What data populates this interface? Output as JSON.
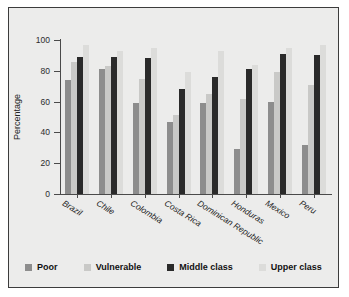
{
  "chart_data": {
    "type": "bar",
    "title": "",
    "xlabel": "",
    "ylabel": "Percentage",
    "ylim": [
      0,
      100
    ],
    "yticks": [
      0,
      20,
      40,
      60,
      80,
      100
    ],
    "grid": false,
    "legend_position": "bottom",
    "categories": [
      "Brazil",
      "Chile",
      "Colombia",
      "Costa Rica",
      "Dominican Republic",
      "Honduras",
      "Mexico",
      "Peru"
    ],
    "series": [
      {
        "name": "Poor",
        "color": "#8d8d8d",
        "values": [
          74,
          81,
          59,
          47,
          59,
          29,
          60,
          32
        ]
      },
      {
        "name": "Vulnerable",
        "color": "#c9c9c7",
        "values": [
          86,
          83,
          75,
          51,
          65,
          62,
          79,
          71
        ]
      },
      {
        "name": "Middle class",
        "color": "#2a2a2a",
        "values": [
          89,
          89,
          88,
          68,
          76,
          81,
          91,
          90
        ]
      },
      {
        "name": "Upper class",
        "color": "#dcdcda",
        "values": [
          97,
          93,
          95,
          79,
          93,
          84,
          95,
          97
        ]
      }
    ]
  },
  "figure": {
    "background": "#ececeb",
    "border_color": "#3c3c3c",
    "axis_color": "#4a4a4a"
  }
}
